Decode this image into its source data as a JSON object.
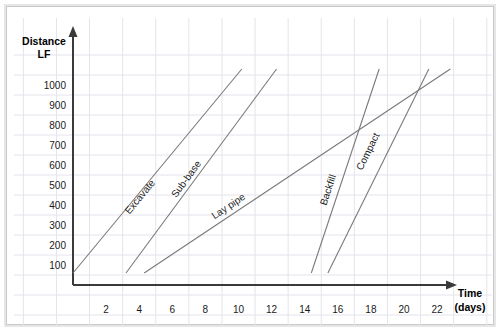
{
  "figure": {
    "background_color": "#ffffff",
    "grid_color": "#e4e4ec",
    "axis_color": "#3a3a3a",
    "line_color": "#7a7a7a"
  },
  "axes": {
    "y_title_line1": "Distance",
    "y_title_line2": "LF",
    "x_title_line1": "Time",
    "x_title_line2": "(days)"
  },
  "chart_data": {
    "type": "line",
    "title": "",
    "xlabel": "Time (days)",
    "ylabel": "Distance LF",
    "xlim": [
      0,
      23.5
    ],
    "ylim": [
      0,
      1120
    ],
    "grid": true,
    "legend_position": "inline-rotated-labels",
    "x_ticks": [
      2,
      4,
      6,
      8,
      10,
      12,
      14,
      16,
      18,
      20,
      22
    ],
    "x_tick_labels": [
      "2",
      "4",
      "6",
      "8",
      "10",
      "12",
      "14",
      "16",
      "18",
      "20",
      "22"
    ],
    "y_ticks": [
      100,
      200,
      300,
      400,
      500,
      600,
      700,
      800,
      900,
      1000
    ],
    "y_tick_labels": [
      "100",
      "200",
      "300",
      "400",
      "500",
      "600",
      "700",
      "800",
      "900",
      "1000"
    ],
    "series": [
      {
        "name": "Excavate",
        "x": [
          0.0,
          10.2
        ],
        "y": [
          60,
          1080
        ],
        "label_x": 4.2,
        "label_y": 430
      },
      {
        "name": "Sub-base",
        "x": [
          3.2,
          12.3
        ],
        "y": [
          60,
          1080
        ],
        "label_x": 7.0,
        "label_y": 520
      },
      {
        "name": "Lay pipe",
        "x": [
          4.3,
          22.8
        ],
        "y": [
          60,
          1080
        ],
        "label_x": 9.5,
        "label_y": 380
      },
      {
        "name": "Backfill",
        "x": [
          14.4,
          18.5
        ],
        "y": [
          60,
          1080
        ],
        "label_x": 15.6,
        "label_y": 470
      },
      {
        "name": "Compact",
        "x": [
          15.4,
          21.5
        ],
        "y": [
          60,
          1080
        ],
        "label_x": 18.0,
        "label_y": 660
      }
    ]
  }
}
